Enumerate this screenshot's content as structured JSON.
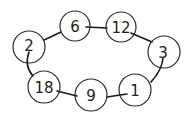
{
  "diagram": {
    "type": "cycle-graph",
    "nodes": [
      {
        "id": "n2",
        "label": "2",
        "cx": 29,
        "cy": 47,
        "r": 16
      },
      {
        "id": "n6",
        "label": "6",
        "cx": 75,
        "cy": 26,
        "r": 15
      },
      {
        "id": "n12",
        "label": "12",
        "cx": 121,
        "cy": 27,
        "r": 15
      },
      {
        "id": "n3",
        "label": "3",
        "cx": 164,
        "cy": 52,
        "r": 16
      },
      {
        "id": "n1",
        "label": "1",
        "cx": 135,
        "cy": 90,
        "r": 16
      },
      {
        "id": "n9",
        "label": "9",
        "cx": 91,
        "cy": 95,
        "r": 16
      },
      {
        "id": "n18",
        "label": "18",
        "cx": 44,
        "cy": 87,
        "r": 16
      }
    ],
    "edges": [
      {
        "from": "2",
        "to": "6"
      },
      {
        "from": "6",
        "to": "12"
      },
      {
        "from": "12",
        "to": "3"
      },
      {
        "from": "3",
        "to": "1"
      },
      {
        "from": "1",
        "to": "9"
      },
      {
        "from": "9",
        "to": "18"
      },
      {
        "from": "18",
        "to": "2"
      }
    ],
    "colors": {
      "stroke": "#1a1a1a",
      "background": "#ffffff"
    }
  }
}
